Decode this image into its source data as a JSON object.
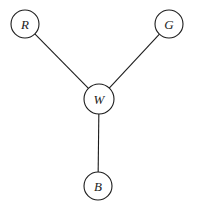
{
  "diagram": {
    "type": "undirected-graph",
    "background_color": "#ffffff",
    "stroke_color": "#1c1c1c",
    "node_fill_color": "#ffffff",
    "stroke_width": 1.1,
    "canvas": {
      "width": 199,
      "height": 215
    },
    "nodes": [
      {
        "id": "R",
        "label": "R",
        "x": 25,
        "y": 24,
        "r": 14
      },
      {
        "id": "G",
        "label": "G",
        "x": 169,
        "y": 24,
        "r": 14
      },
      {
        "id": "W",
        "label": "W",
        "x": 99,
        "y": 99,
        "r": 15
      },
      {
        "id": "B",
        "label": "B",
        "x": 98,
        "y": 186,
        "r": 14
      }
    ],
    "edges": [
      {
        "from": "R",
        "to": "W"
      },
      {
        "from": "G",
        "to": "W"
      },
      {
        "from": "W",
        "to": "B"
      }
    ]
  }
}
